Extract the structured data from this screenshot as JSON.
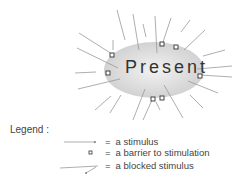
{
  "center": {
    "label": "Present"
  },
  "legend": {
    "title": "Legend :",
    "items": [
      {
        "symbol": "arrow",
        "text": "a stimulus"
      },
      {
        "symbol": "square",
        "text": "a barrier to stimulation"
      },
      {
        "symbol": "blocked-arrow",
        "text": "a blocked  stimulus"
      }
    ],
    "equals": "="
  },
  "colors": {
    "ellipse_fill": "#d9d9d9",
    "line": "#8c8c8c",
    "text": "#333333"
  }
}
